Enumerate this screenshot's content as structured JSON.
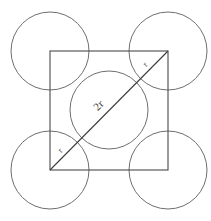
{
  "figure": {
    "canvas": {
      "width": 211,
      "height": 221,
      "background": "#ffffff"
    },
    "colors": {
      "square_stroke": "#4a4a4a",
      "circle_stroke": "#6e6e6e",
      "diagonal_stroke": "#3c3c3c",
      "label_fill": "#3a3a3a"
    },
    "square": {
      "name": "square",
      "left": 50,
      "top": 51,
      "right": 168,
      "bottom": 170,
      "side_px": 118,
      "stroke_width": 1.1
    },
    "circles": [
      {
        "name": "circle-top-left",
        "cx": 50,
        "cy": 51,
        "r": 39,
        "stroke_width": 1.0
      },
      {
        "name": "circle-top-right",
        "cx": 168,
        "cy": 51,
        "r": 39,
        "stroke_width": 1.0
      },
      {
        "name": "circle-bottom-left",
        "cx": 50,
        "cy": 170,
        "r": 39,
        "stroke_width": 1.0
      },
      {
        "name": "circle-bottom-right",
        "cx": 168,
        "cy": 170,
        "r": 39,
        "stroke_width": 1.0
      },
      {
        "name": "circle-center",
        "cx": 109,
        "cy": 110,
        "r": 39,
        "stroke_width": 1.0
      }
    ],
    "diagonal": {
      "name": "diagonal-line",
      "x1": 50,
      "y1": 170,
      "x2": 168,
      "y2": 51,
      "stroke_width": 1.1
    },
    "labels": {
      "center": {
        "text": "2r",
        "x": 101,
        "y": 108,
        "font_size": 11,
        "rotation": -45
      },
      "upper_right": {
        "text": "r",
        "x": 147,
        "y": 66,
        "font_size": 8,
        "rotation": -45
      },
      "lower_left": {
        "text": "r",
        "x": 62,
        "y": 152,
        "font_size": 8,
        "rotation": -45
      }
    }
  }
}
